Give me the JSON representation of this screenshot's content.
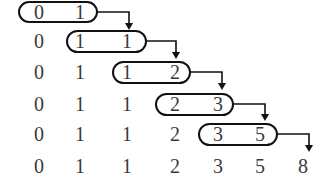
{
  "diagram": {
    "rows": [
      [
        "0",
        "1"
      ],
      [
        "0",
        "1",
        "1"
      ],
      [
        "0",
        "1",
        "1",
        "2"
      ],
      [
        "0",
        "1",
        "1",
        "2",
        "3"
      ],
      [
        "0",
        "1",
        "1",
        "2",
        "3",
        "5"
      ],
      [
        "0",
        "1",
        "1",
        "2",
        "3",
        "5",
        "8"
      ]
    ],
    "highlighted_pairs": [
      {
        "row": 0,
        "from_col": 0,
        "to_col": 1,
        "values": [
          "0",
          "1"
        ],
        "result": "1"
      },
      {
        "row": 1,
        "from_col": 1,
        "to_col": 2,
        "values": [
          "1",
          "1"
        ],
        "result": "2"
      },
      {
        "row": 2,
        "from_col": 2,
        "to_col": 3,
        "values": [
          "1",
          "2"
        ],
        "result": "3"
      },
      {
        "row": 3,
        "from_col": 3,
        "to_col": 4,
        "values": [
          "2",
          "3"
        ],
        "result": "5"
      },
      {
        "row": 4,
        "from_col": 4,
        "to_col": 5,
        "values": [
          "3",
          "5"
        ],
        "result": "8"
      }
    ],
    "colors": {
      "text": "#3a3a3a",
      "stroke": "#111111",
      "background": "#ffffff"
    }
  }
}
